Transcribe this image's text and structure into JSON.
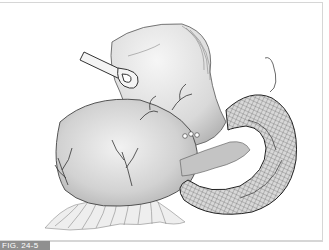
{
  "figure": {
    "label": "FIG. 24-5",
    "kind": "surgical illustration",
    "colors": {
      "frame": "#d6d6d6",
      "label_bg": "#8f8f8f",
      "label_text": "#ffffff",
      "tissue_fill": "#cfcfcf",
      "line": "#3a3a3a"
    },
    "elements": [
      "stomach",
      "forceps-clamp",
      "vessels",
      "loop-of-bowel",
      "suture-thread",
      "omentum"
    ]
  }
}
